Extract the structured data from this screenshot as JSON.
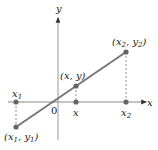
{
  "diagram": {
    "title": "",
    "axes": {
      "x_label": "x",
      "y_label": "y",
      "origin_label": "0"
    },
    "points": [
      {
        "id": "p1",
        "label": "(x1, y1)",
        "label_parts": {
          "x": "x",
          "xs": "1",
          "y": "y",
          "ys": "1"
        },
        "axis_label": "x1",
        "axis_parts": {
          "v": "x",
          "s": "1"
        }
      },
      {
        "id": "p",
        "label": "(x, y)",
        "label_parts": {
          "x": "x",
          "y": "y"
        },
        "axis_label": "x"
      },
      {
        "id": "p2",
        "label": "(x2, y2)",
        "label_parts": {
          "x": "x",
          "xs": "2",
          "y": "y",
          "ys": "2"
        },
        "axis_label": "x2",
        "axis_parts": {
          "v": "x",
          "s": "2"
        }
      }
    ],
    "colors": {
      "axis": "#888888",
      "line": "#777777",
      "point": "#666666",
      "dashed": "#777777",
      "text": "#222222"
    }
  }
}
